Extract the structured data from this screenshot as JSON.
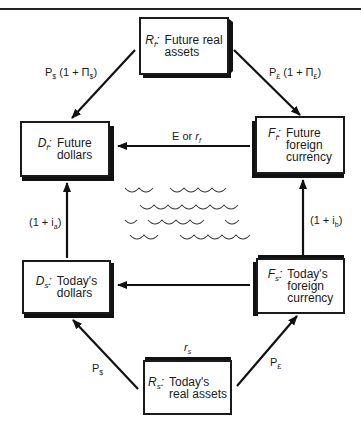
{
  "diagram": {
    "nodes": {
      "future_real_assets": {
        "symbol": "R",
        "subscript": "f",
        "label": "Future real\nassets"
      },
      "future_dollars": {
        "symbol": "D",
        "subscript": "f",
        "label": "Future\ndollars"
      },
      "future_foreign_currency": {
        "symbol": "F",
        "subscript": "f",
        "label": "Future\nforeign\ncurrency"
      },
      "todays_dollars": {
        "symbol": "D",
        "subscript": "s",
        "label": "Today's\ndollars"
      },
      "todays_foreign_currency": {
        "symbol": "F",
        "subscript": "s",
        "label": "Today's\nforeign\ncurrency"
      },
      "todays_real_assets": {
        "symbol": "R",
        "subscript": "s",
        "label": "Today's\nreal assets"
      }
    },
    "edges": {
      "rf_to_df": {
        "base": "P",
        "base_sub": "$",
        "rest": " (1 + Π",
        "rest_sub": "$",
        "close": ")"
      },
      "rf_to_ff": {
        "base": "P",
        "base_sub": "£",
        "rest": " (1 + Π",
        "rest_sub": "£",
        "close": ")"
      },
      "ff_to_df": {
        "text": "E or ",
        "var": "r",
        "var_sub": "f"
      },
      "ds_to_df": {
        "text": "(1 + i",
        "sub": "a",
        "close": ")"
      },
      "fs_to_ff": {
        "text": "(1 + i",
        "sub": "b",
        "close": ")"
      },
      "rs_to_ds": {
        "base": "P",
        "base_sub": "$"
      },
      "rs_to_fs": {
        "base": "P",
        "base_sub": "£"
      },
      "rs_top": {
        "var": "r",
        "var_sub": "s"
      },
      "fs_to_ds": {
        "text": ""
      }
    },
    "decoration": "waves"
  }
}
